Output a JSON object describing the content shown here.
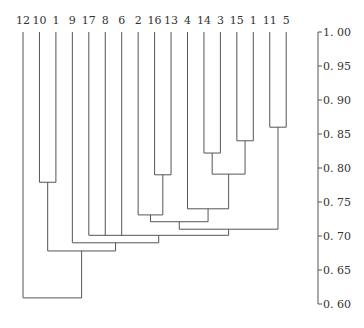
{
  "chart_data": {
    "type": "dendrogram",
    "title": "",
    "xlabel": "",
    "ylabel": "",
    "axis": {
      "position": "right",
      "ylim": [
        0.6,
        1.0
      ],
      "ticks": [
        "1.00",
        "0.95",
        "0.90",
        "0.85",
        "0.80",
        "0.75",
        "0.70",
        "0.65",
        "0.60"
      ]
    },
    "grid": false,
    "leaves": [
      "12",
      "10",
      "1",
      "9",
      "17",
      "8",
      "6",
      "2",
      "16",
      "13",
      "4",
      "14",
      "3",
      "15",
      "1",
      "11",
      "5"
    ],
    "merges": [
      {
        "id": "c1",
        "children": [
          "11",
          "5"
        ],
        "height": 0.86
      },
      {
        "id": "c2",
        "children": [
          "15",
          "1b"
        ],
        "height": 0.84
      },
      {
        "id": "c3",
        "children": [
          "14",
          "3"
        ],
        "height": 0.822
      },
      {
        "id": "c4",
        "children": [
          "c3",
          "c2"
        ],
        "height": 0.791
      },
      {
        "id": "c5",
        "children": [
          "16",
          "13"
        ],
        "height": 0.79
      },
      {
        "id": "c6",
        "children": [
          "10",
          "1a"
        ],
        "height": 0.779
      },
      {
        "id": "c7",
        "children": [
          "4",
          "c4"
        ],
        "height": 0.74
      },
      {
        "id": "c8",
        "children": [
          "2",
          "c5"
        ],
        "height": 0.731
      },
      {
        "id": "c9",
        "children": [
          "c8",
          "c7"
        ],
        "height": 0.721
      },
      {
        "id": "c10",
        "children": [
          "c9",
          "c1"
        ],
        "height": 0.71
      },
      {
        "id": "c11",
        "children": [
          "17",
          "8",
          "6",
          "c10"
        ],
        "height": 0.701
      },
      {
        "id": "c12",
        "children": [
          "9",
          "c11"
        ],
        "height": 0.69
      },
      {
        "id": "c13",
        "children": [
          "c6",
          "c12"
        ],
        "height": 0.678
      },
      {
        "id": "c14",
        "children": [
          "12",
          "c13"
        ],
        "height": 0.609
      }
    ]
  }
}
